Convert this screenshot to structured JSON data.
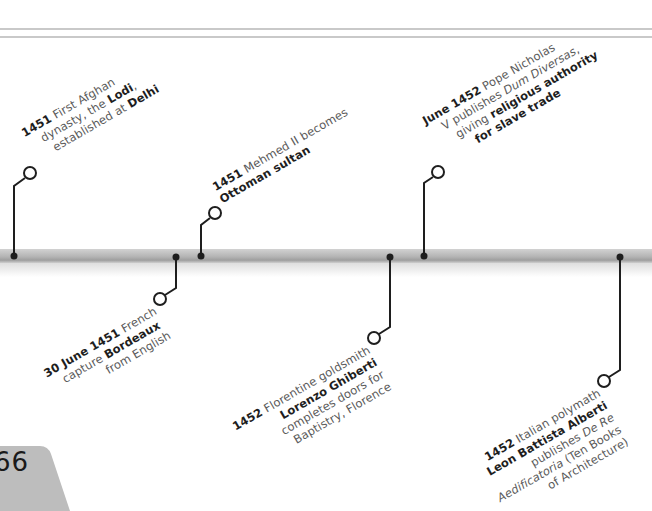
{
  "page": {
    "number": "66"
  },
  "timeline": {
    "bar_color": "#b4b4b4",
    "connector_color": "#1e1e1e",
    "events": [
      {
        "id": "lodi",
        "position": "above",
        "date": "1451",
        "lines": [
          "First Afghan",
          "dynasty, the Lodi,",
          "established at Delhi"
        ],
        "bold_terms": [
          "Lodi",
          "Delhi"
        ],
        "text_parts": {
          "l1_date": "1451",
          "l1_rest": " First Afghan",
          "l2_a": "dynasty, the ",
          "l2_b": "Lodi",
          "l2_c": ",",
          "l3_a": "established at ",
          "l3_b": "Delhi"
        }
      },
      {
        "id": "mehmed",
        "position": "above",
        "date": "1451",
        "lines": [
          "Mehmed II becomes",
          "Ottoman sultan"
        ],
        "bold_terms": [
          "Ottoman sultan"
        ],
        "text_parts": {
          "l1_date": "1451",
          "l1_rest": " Mehmed II becomes",
          "l2_b": "Ottoman sultan"
        }
      },
      {
        "id": "dum-diversas",
        "position": "above",
        "date": "June 1452",
        "lines": [
          "Pope Nicholas",
          "V publishes Dum Diversas,",
          "giving religious authority",
          "for slave trade"
        ],
        "bold_terms": [
          "religious authority",
          "for slave trade"
        ],
        "italic_terms": [
          "Dum Diversas"
        ],
        "text_parts": {
          "l1_date": "June 1452",
          "l1_rest": " Pope Nicholas",
          "l2_a": "V publishes ",
          "l2_i": "Dum Diversas",
          "l2_c": ",",
          "l3_a": "giving ",
          "l3_b": "religious authority",
          "l4_b": "for slave trade"
        }
      },
      {
        "id": "bordeaux",
        "position": "below",
        "date": "30 June 1451",
        "lines": [
          "French",
          "capture Bordeaux",
          "from English"
        ],
        "bold_terms": [
          "Bordeaux"
        ],
        "text_parts": {
          "l1_date": "30 June 1451",
          "l1_rest": " French",
          "l2_a": "capture ",
          "l2_b": "Bordeaux",
          "l3_a": "from English"
        }
      },
      {
        "id": "ghiberti",
        "position": "below",
        "date": "1452",
        "lines": [
          "Florentine goldsmith",
          "Lorenzo Ghiberti",
          "completes doors for",
          "Baptistry, Florence"
        ],
        "bold_terms": [
          "Lorenzo Ghiberti"
        ],
        "text_parts": {
          "l1_date": "1452",
          "l1_rest": " Florentine goldsmith",
          "l2_b": "Lorenzo Ghiberti",
          "l3_a": "completes doors for",
          "l4_a": "Baptistry, Florence"
        }
      },
      {
        "id": "alberti",
        "position": "below",
        "date": "1452",
        "lines": [
          "Italian polymath",
          "Leon Battista Alberti",
          "publishes De Re",
          "Aedificatoria (Ten Books",
          "of Architecture)"
        ],
        "bold_terms": [
          "Leon Battista Alberti"
        ],
        "italic_terms": [
          "De Re Aedificatoria"
        ],
        "text_parts": {
          "l1_date": "1452",
          "l1_rest": " Italian polymath",
          "l2_b": "Leon Battista Alberti",
          "l3_a": "publishes ",
          "l3_i": "De Re",
          "l4_i": "Aedificatoria",
          "l4_a": " (Ten Books",
          "l5_a": "of Architecture)"
        }
      }
    ]
  }
}
